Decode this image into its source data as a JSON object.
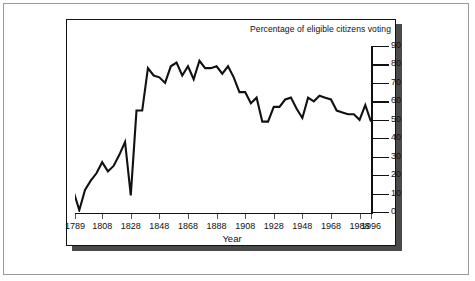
{
  "chart_data": {
    "type": "line",
    "title": "Percentage of eligible citizens voting",
    "xlabel": "Year",
    "ylabel": "",
    "xlim": [
      1789,
      1996
    ],
    "ylim": [
      0,
      90
    ],
    "grid": false,
    "legend": "none",
    "y_ticks": [
      90,
      80,
      70,
      60,
      50,
      40,
      30,
      20,
      10,
      0
    ],
    "x_ticks": [
      1789,
      1808,
      1828,
      1848,
      1868,
      1888,
      1908,
      1928,
      1948,
      1968,
      1988,
      1996
    ],
    "series": [
      {
        "name": "Percentage of eligible citizens voting",
        "color": "#111111",
        "x": [
          1788,
          1792,
          1796,
          1800,
          1804,
          1808,
          1812,
          1816,
          1820,
          1824,
          1828,
          1832,
          1836,
          1840,
          1844,
          1848,
          1852,
          1856,
          1860,
          1864,
          1868,
          1872,
          1876,
          1880,
          1884,
          1888,
          1892,
          1896,
          1900,
          1904,
          1908,
          1912,
          1916,
          1920,
          1924,
          1928,
          1932,
          1936,
          1940,
          1944,
          1948,
          1952,
          1956,
          1960,
          1964,
          1968,
          1972,
          1976,
          1980,
          1984,
          1988,
          1992,
          1996
        ],
        "values": [
          11,
          1,
          12,
          17,
          21,
          27,
          22,
          25,
          31,
          38,
          9,
          55,
          55,
          78,
          74,
          73,
          70,
          79,
          81,
          74,
          79,
          72,
          82,
          78,
          78,
          79,
          75,
          79,
          73,
          65,
          65,
          59,
          62,
          49,
          49,
          57,
          57,
          61,
          62,
          56,
          51,
          62,
          60,
          63,
          62,
          61,
          55,
          54,
          53,
          53,
          50,
          58,
          49
        ]
      }
    ]
  }
}
